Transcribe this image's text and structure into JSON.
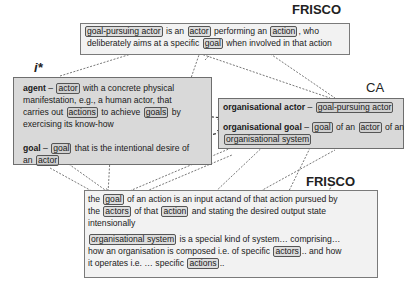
{
  "labels": {
    "frisco_top": "FRISCO",
    "istar": "i*",
    "ca": "CA",
    "frisco_bottom": "FRISCO"
  },
  "frisco_top": {
    "term": "goal-pursuing actor",
    "t1": "is an",
    "ref_actor": "actor",
    "t2": "performing an",
    "ref_action": "action",
    "t3": ", who",
    "t4": "deliberately aims at a specific",
    "ref_goal": "goal",
    "t5": "when involved in that action"
  },
  "istar": {
    "agent_term": "agent",
    "agent_dash": " –",
    "agent_ref_actor": "actor",
    "agent_t1": "with a concrete physical",
    "agent_t2": "manifestation, e.g., a human actor, that",
    "agent_t3": "carries out",
    "agent_ref_actions": "actions",
    "agent_t4": "to achieve",
    "agent_ref_goals": "goals",
    "agent_t5": "by",
    "agent_t6": "exercising its know-how",
    "goal_term": "goal",
    "goal_dash": " –",
    "goal_ref_goal": "goal",
    "goal_t1": "that is the intentional desire of",
    "goal_t2": "an",
    "goal_ref_actor": "actor"
  },
  "ca": {
    "actor_term": "organisational actor",
    "actor_dash": " –",
    "actor_ref": "goal-pursuing actor",
    "goal_term": "organisational goal",
    "goal_dash": " –",
    "goal_ref_goal": "goal",
    "goal_t1": "of an",
    "goal_ref_actor": "actor",
    "goal_t2": "of an",
    "goal_ref_system": "organisational system"
  },
  "frisco_bottom": {
    "p1_t0": "the",
    "p1_ref_goal": "goal",
    "p1_t1": "of an action is an input actand of that action pursued by",
    "p1_t2": "the",
    "p1_ref_actors": "actors",
    "p1_t3": "of that",
    "p1_ref_action": "action",
    "p1_t4": "and stating the desired output state",
    "p1_t5": "intensionally",
    "p2_ref_system": "organisational system",
    "p2_t1": "is a special kind of system… comprising…",
    "p2_t2": "how an organisation is composed i.e. of specific",
    "p2_ref_actors": "actors",
    "p2_t3": ".. and how",
    "p2_t4": "it operates i.e. … specific",
    "p2_ref_actions": "actions",
    "p2_t5": ".."
  }
}
